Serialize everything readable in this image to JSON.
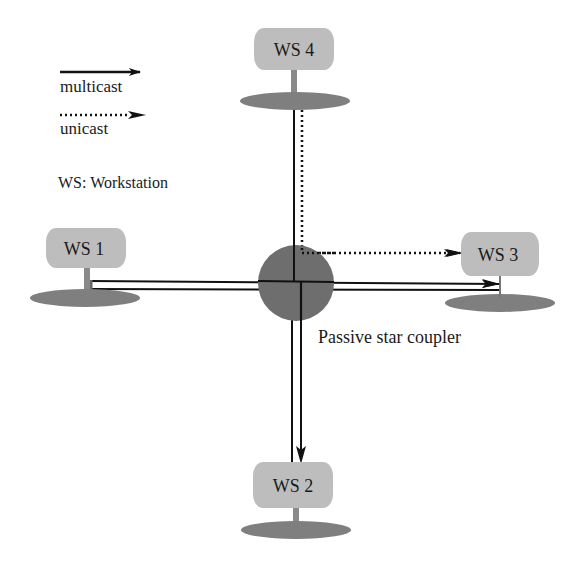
{
  "legend": {
    "multicast_label": "multicast",
    "unicast_label": "unicast",
    "ws_definition": "WS: Workstation"
  },
  "coupler": {
    "label": "Passive star coupler",
    "color": "#6e6e6e"
  },
  "workstations": [
    {
      "id": "ws1",
      "label": "WS 1"
    },
    {
      "id": "ws2",
      "label": "WS 2"
    },
    {
      "id": "ws3",
      "label": "WS 3"
    },
    {
      "id": "ws4",
      "label": "WS 4"
    }
  ],
  "colors": {
    "box_fill": "#bdbdbd",
    "base_fill": "#7f7f7f",
    "line": "#111111"
  },
  "links": [
    {
      "from": "ws1",
      "to": "ws3",
      "type": "multicast"
    },
    {
      "from": "ws4",
      "to": "ws2",
      "type": "multicast"
    },
    {
      "from": "ws4",
      "to": "ws3",
      "type": "unicast"
    }
  ]
}
